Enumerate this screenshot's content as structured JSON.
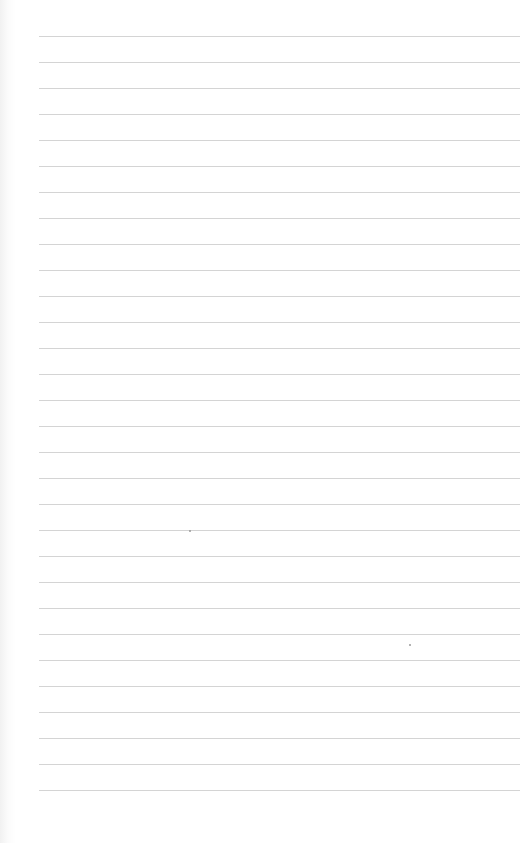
{
  "sheet": {
    "type": "lined-paper",
    "ruled_line_count": 30,
    "first_line_y": 36,
    "line_spacing_px": 26,
    "line_left_x": 39,
    "line_right_x": 520,
    "line_color": "#cfcfcf",
    "paper_color": "#ffffff"
  }
}
